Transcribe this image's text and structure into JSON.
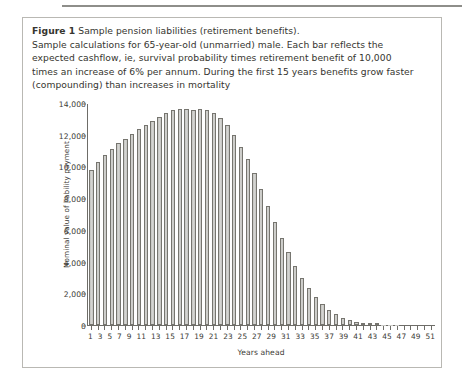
{
  "figure": {
    "label": "Figure 1",
    "title": " Sample pension liabilities (retirement benefits).",
    "caption_lines": [
      "Sample calculations for 65-year-old (unmarried) male. Each bar reflects the",
      "expected cashflow, ie, survival probability times retirement benefit of 10,000",
      "times an increase of 6% per annum. During the first 15 years benefits grow faster",
      "(compounding) than increases in mortality"
    ]
  },
  "colors": {
    "bar_fill": "#c9c9c6",
    "bar_edge": "#76756f",
    "axis": "#6e6d68",
    "text": "#3c3b36",
    "box_border": "#b9b8b3",
    "rule": "#8e8e8a"
  },
  "chart_data": {
    "type": "bar",
    "title": "",
    "xlabel": "Years ahead",
    "ylabel": "Nominal value of liability payment",
    "ylim": [
      0,
      14000
    ],
    "yticks": [
      0,
      2000,
      4000,
      6000,
      8000,
      10000,
      12000,
      14000
    ],
    "ytick_labels": [
      "0",
      "2,000",
      "4,000",
      "6,000",
      "8,000",
      "10,000",
      "12,000",
      "14,000"
    ],
    "grid": false,
    "legend": null,
    "xlim": [
      1,
      51
    ],
    "categories": [
      1,
      2,
      3,
      4,
      5,
      6,
      7,
      8,
      9,
      10,
      11,
      12,
      13,
      14,
      15,
      16,
      17,
      18,
      19,
      20,
      21,
      22,
      23,
      24,
      25,
      26,
      27,
      28,
      29,
      30,
      31,
      32,
      33,
      34,
      35,
      36,
      37,
      38,
      39,
      40,
      41,
      42,
      43,
      44,
      45,
      46,
      47,
      48,
      49,
      50,
      51
    ],
    "xtick_labels_shown": [
      1,
      3,
      5,
      7,
      9,
      11,
      13,
      15,
      17,
      19,
      21,
      23,
      25,
      27,
      29,
      31,
      33,
      35,
      37,
      39,
      41,
      43,
      45,
      47,
      49,
      51
    ],
    "values": [
      9800,
      10300,
      10750,
      11150,
      11500,
      11800,
      12100,
      12400,
      12700,
      12950,
      13200,
      13450,
      13600,
      13700,
      13700,
      13650,
      13700,
      13650,
      13400,
      13100,
      12650,
      12050,
      11300,
      10500,
      9600,
      8600,
      7550,
      6500,
      5500,
      4600,
      3750,
      3000,
      2350,
      1800,
      1350,
      980,
      690,
      470,
      310,
      200,
      125,
      75,
      45,
      25,
      15,
      8,
      4,
      2,
      1,
      0.5,
      0.2
    ]
  }
}
